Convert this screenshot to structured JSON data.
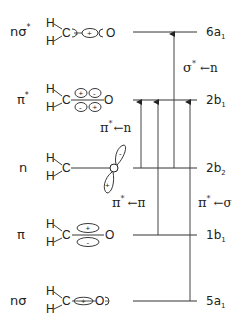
{
  "diagram": {
    "type": "molecular-orbital-energy-diagram",
    "molecule": "H2C=O (formaldehyde)",
    "orbitals": [
      {
        "label": "nσ*",
        "name_main": "nσ",
        "name_sup": "*",
        "symmetry": "6a",
        "symmetry_sub": "1",
        "signs": [
          "-",
          "+"
        ]
      },
      {
        "label": "π*",
        "name_main": "π",
        "name_sup": "*",
        "symmetry": "2b",
        "symmetry_sub": "1",
        "signs": [
          "+",
          "-",
          "-",
          "+"
        ]
      },
      {
        "label": "n",
        "name_main": "n",
        "name_sup": "",
        "symmetry": "2b",
        "symmetry_sub": "2",
        "signs": [
          "-",
          "+"
        ]
      },
      {
        "label": "π",
        "name_main": "π",
        "name_sup": "",
        "symmetry": "1b",
        "symmetry_sub": "1",
        "signs": [
          "+",
          "-"
        ]
      },
      {
        "label": "nσ",
        "name_main": "nσ",
        "name_sup": "",
        "symmetry": "5a",
        "symmetry_sub": "1",
        "signs": [
          "+"
        ]
      }
    ],
    "atoms": {
      "h": "H",
      "c": "C",
      "o": "O"
    },
    "transitions": [
      {
        "label": "σ* ← n",
        "main": "σ",
        "sup": "*",
        "arrow": "←n",
        "from": "2b2",
        "to": "6a1"
      },
      {
        "label": "π* ← n",
        "main": "π",
        "sup": "*",
        "arrow": "←n",
        "from": "2b2",
        "to": "2b1"
      },
      {
        "label": "π* ← π",
        "main": "π",
        "sup": "*",
        "arrow": "←π",
        "from": "1b1",
        "to": "2b1"
      },
      {
        "label": "π* ← σ",
        "main": "π",
        "sup": "*",
        "arrow": "←σ",
        "from": "5a1",
        "to": "2b1"
      }
    ]
  }
}
